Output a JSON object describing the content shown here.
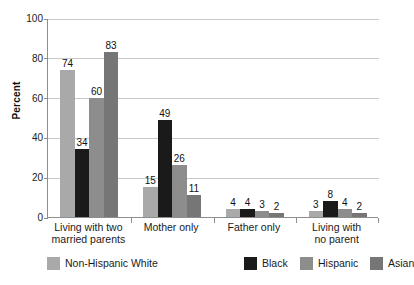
{
  "chart_data": {
    "type": "bar",
    "title": "",
    "xlabel": "",
    "ylabel": "Percent",
    "ylim": [
      0,
      100
    ],
    "yticks": [
      0,
      20,
      40,
      60,
      80,
      100
    ],
    "grid": true,
    "legend_position": "bottom",
    "categories": [
      "Living with two married parents",
      "Mother only",
      "Father only",
      "Living with no parent"
    ],
    "category_lines": [
      [
        "Living with two",
        "married parents"
      ],
      [
        "Mother only"
      ],
      [
        "Father only"
      ],
      [
        "Living with",
        "no parent"
      ]
    ],
    "series": [
      {
        "name": "Non-Hispanic White",
        "color": "#a9a9a9",
        "values": [
          74,
          15,
          4,
          3
        ]
      },
      {
        "name": "Black",
        "color": "#1a1a1a",
        "values": [
          34,
          49,
          4,
          8
        ]
      },
      {
        "name": "Hispanic",
        "color": "#8d8d8d",
        "values": [
          60,
          26,
          3,
          4
        ]
      },
      {
        "name": "Asian",
        "color": "#767676",
        "values": [
          83,
          11,
          2,
          2
        ]
      }
    ]
  },
  "axis": {
    "y_title": "Percent",
    "y_tick_labels": [
      "100",
      "80",
      "60",
      "40",
      "20",
      "0"
    ]
  },
  "legend": {
    "items": [
      {
        "label": "Non-Hispanic White",
        "color": "#a9a9a9"
      },
      {
        "label": "Black",
        "color": "#1a1a1a"
      },
      {
        "label": "Hispanic",
        "color": "#8d8d8d"
      },
      {
        "label": "Asian",
        "color": "#767676"
      }
    ]
  }
}
